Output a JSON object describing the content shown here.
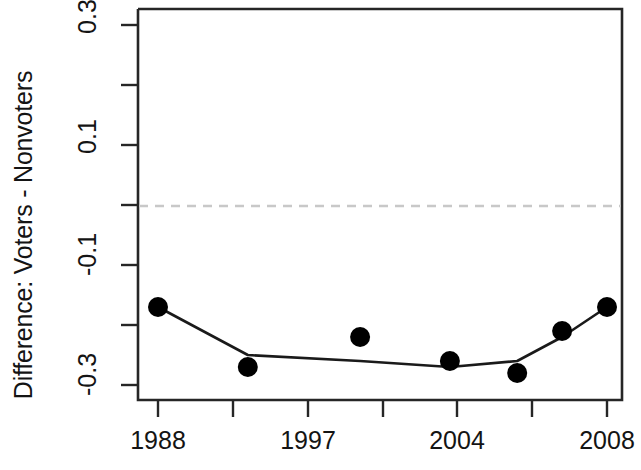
{
  "chart_data": {
    "type": "line",
    "title": "",
    "xlabel": "",
    "ylabel": "Difference: Voters - Nonvoters",
    "x": [
      1988,
      1992,
      1997,
      2001,
      2004,
      2006,
      2008
    ],
    "values": [
      -0.17,
      -0.27,
      -0.22,
      -0.26,
      -0.28,
      -0.21,
      -0.17
    ],
    "series": [
      {
        "name": "Difference: Voters - Nonvoters",
        "values": [
          -0.17,
          -0.27,
          -0.22,
          -0.26,
          -0.28,
          -0.21,
          -0.17
        ]
      },
      {
        "name": "fitted trend",
        "values": [
          -0.17,
          -0.25,
          -0.26,
          -0.27,
          -0.26,
          -0.22,
          -0.17
        ]
      }
    ],
    "xtick_values": [
      1988,
      1992,
      1997,
      2001,
      2004,
      2006,
      2008
    ],
    "xtick_labels": [
      "1988",
      "",
      "1997",
      "",
      "2004",
      "",
      "2008"
    ],
    "ytick_values": [
      0.3,
      0.2,
      0.1,
      0.0,
      -0.1,
      -0.2,
      -0.3
    ],
    "ytick_labels": [
      "0.3",
      "",
      "0.1",
      "",
      "-0.1",
      "",
      "-0.3"
    ],
    "xlim": [
      1988,
      2008
    ],
    "ylim": [
      -0.3,
      0.3
    ],
    "grid": false,
    "legend": "none",
    "reference_line": {
      "value": 0.0,
      "style": "dashed",
      "color": "#c8c8c8"
    },
    "marker_color": "#000000",
    "line_color": "#1a1a1a"
  },
  "axis": {
    "y_title": "Difference: Voters - Nonvoters",
    "y_labels": [
      {
        "text": "0.3",
        "value": 0.3
      },
      {
        "text": "0.1",
        "value": 0.1
      },
      {
        "text": "-0.1",
        "value": -0.1
      },
      {
        "text": "-0.3",
        "value": -0.3
      }
    ],
    "x_labels": [
      {
        "text": "1988",
        "value": 1988
      },
      {
        "text": "1997",
        "value": 1997
      },
      {
        "text": "2004",
        "value": 2004
      },
      {
        "text": "2008",
        "value": 2008
      }
    ]
  }
}
